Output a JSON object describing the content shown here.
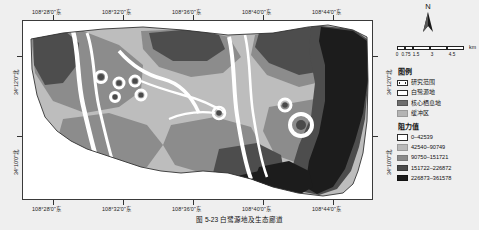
{
  "figure": {
    "caption": "图 5-23  白鹭源地及生态廊道"
  },
  "axes": {
    "longitude_ticks": [
      "108°28'0\"东",
      "108°32'0\"东",
      "108°36'0\"东",
      "108°40'0\"东",
      "108°44'0\"东"
    ],
    "latitude_ticks": [
      "34°12'0\"北",
      "34°10'0\"北"
    ]
  },
  "north_arrow": {
    "label": "N",
    "icon": "north-arrow-icon"
  },
  "scale_bar": {
    "unit": "km",
    "ticks": [
      "0",
      "0.75",
      "1.5",
      "3",
      "4.5"
    ]
  },
  "legend": {
    "title": "图例",
    "items": [
      {
        "label": "研究范围",
        "color": "#ffffff",
        "style": "outline-dashed"
      },
      {
        "label": "白鹭源地",
        "color": "#ffffff",
        "style": "outline"
      },
      {
        "label": "核心栖息地",
        "color": "#6f6f6f",
        "style": "fill"
      },
      {
        "label": "缓冲区",
        "color": "#b4b4b4",
        "style": "fill"
      }
    ],
    "subtitle": "阻力值",
    "resistance": [
      {
        "label": "0–42539",
        "color": "#ffffff"
      },
      {
        "label": "42540–90749",
        "color": "#b9b9b9"
      },
      {
        "label": "90750–151721",
        "color": "#8a8a8a"
      },
      {
        "label": "151722–226872",
        "color": "#4a4a4a"
      },
      {
        "label": "226873–361578",
        "color": "#1a1a1a"
      }
    ]
  },
  "map": {
    "title": "白鹭源地及生态廊道阻力面分布图",
    "palette": {
      "class1": "#ffffff",
      "class2": "#bdbdbd",
      "class3": "#8c8c8c",
      "class4": "#4d4d4d",
      "class5": "#1c1c1c",
      "background": "#ffffff",
      "outline": "#3a3a3a"
    }
  }
}
